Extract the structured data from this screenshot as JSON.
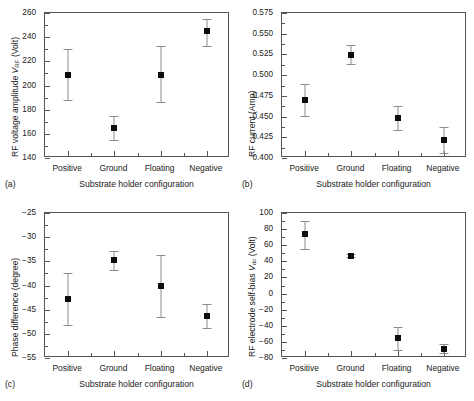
{
  "figure": {
    "shared_xlabel": "Substrate holder configuration",
    "categories": [
      "Positive",
      "Ground",
      "Floating",
      "Negative"
    ]
  },
  "panels": [
    {
      "letter": "(a)",
      "ylabel_pre": "RF voltage amplitude ",
      "ylabel_sym": "V",
      "ylabel_sub": "RF",
      "ylabel_post": " (Volt)",
      "ylabel_plain": "RF voltage amplitude V_RF (Volt)"
    },
    {
      "letter": "(b)",
      "ylabel_pre": "RF current (Amp)",
      "ylabel_sym": "",
      "ylabel_sub": "",
      "ylabel_post": "",
      "ylabel_plain": "RF current (Amp)"
    },
    {
      "letter": "(c)",
      "ylabel_pre": "Phase difference (degree)",
      "ylabel_sym": "",
      "ylabel_sub": "",
      "ylabel_post": "",
      "ylabel_plain": "Phase difference (degree)"
    },
    {
      "letter": "(d)",
      "ylabel_pre": "RF electrode self-bias ",
      "ylabel_sym": "V",
      "ylabel_sub": "dc",
      "ylabel_post": " (Volt)",
      "ylabel_plain": "RF electrode self-bias V_dc (Volt)"
    }
  ],
  "chart_data": [
    {
      "type": "scatter",
      "panel": "a",
      "title": "",
      "xlabel": "Substrate holder configuration",
      "ylabel": "RF voltage amplitude V_RF (Volt)",
      "categories": [
        "Positive",
        "Ground",
        "Floating",
        "Negative"
      ],
      "values": [
        209,
        165,
        209,
        245
      ],
      "err_low": [
        188,
        155,
        186,
        233
      ],
      "err_high": [
        230,
        175,
        233,
        255
      ],
      "ylim": [
        140,
        260
      ],
      "yticks": [
        140,
        160,
        180,
        200,
        220,
        240,
        260
      ],
      "ytick_labels": [
        "140",
        "160",
        "180",
        "200",
        "220",
        "240",
        "260"
      ],
      "minor_ticks_per_interval": 1,
      "grid": false,
      "legend": "none"
    },
    {
      "type": "scatter",
      "panel": "b",
      "title": "",
      "xlabel": "Substrate holder configuration",
      "ylabel": "RF current (Amp)",
      "categories": [
        "Positive",
        "Ground",
        "Floating",
        "Negative"
      ],
      "values": [
        0.47,
        0.524,
        0.448,
        0.422
      ],
      "err_low": [
        0.451,
        0.513,
        0.434,
        0.406
      ],
      "err_high": [
        0.489,
        0.536,
        0.463,
        0.438
      ],
      "ylim": [
        0.4,
        0.575
      ],
      "yticks": [
        0.4,
        0.425,
        0.45,
        0.475,
        0.5,
        0.525,
        0.55,
        0.575
      ],
      "ytick_labels": [
        "0.400",
        "0.425",
        "0.450",
        "0.475",
        "0.500",
        "0.525",
        "0.550",
        "0.575"
      ],
      "minor_ticks_per_interval": 1,
      "grid": false,
      "legend": "none"
    },
    {
      "type": "scatter",
      "panel": "c",
      "title": "",
      "xlabel": "Substrate holder configuration",
      "ylabel": "Phase difference (degree)",
      "categories": [
        "Positive",
        "Ground",
        "Floating",
        "Negative"
      ],
      "values": [
        -42.8,
        -34.8,
        -40.2,
        -46.3
      ],
      "err_low": [
        -48.2,
        -36.8,
        -46.6,
        -48.7
      ],
      "err_high": [
        -37.5,
        -32.8,
        -33.6,
        -43.8
      ],
      "ylim": [
        -55,
        -25
      ],
      "yticks": [
        -55,
        -50,
        -45,
        -40,
        -35,
        -30,
        -25
      ],
      "ytick_labels": [
        "−55",
        "−50",
        "−45",
        "−40",
        "−35",
        "−30",
        "−25"
      ],
      "minor_ticks_per_interval": 1,
      "grid": false,
      "legend": "none"
    },
    {
      "type": "scatter",
      "panel": "d",
      "title": "",
      "xlabel": "Substrate holder configuration",
      "ylabel": "RF electrode self-bias V_dc (Volt)",
      "categories": [
        "Positive",
        "Ground",
        "Floating",
        "Negative"
      ],
      "values": [
        74,
        47,
        -55,
        -69
      ],
      "err_low": [
        55,
        45,
        -70,
        -74
      ],
      "err_high": [
        90,
        49,
        -42,
        -63
      ],
      "ylim": [
        -80,
        100
      ],
      "yticks": [
        -80,
        -60,
        -40,
        -20,
        0,
        20,
        40,
        60,
        80,
        100
      ],
      "ytick_labels": [
        "−80",
        "−60",
        "−40",
        "−20",
        "0",
        "20",
        "40",
        "60",
        "80",
        "100"
      ],
      "minor_ticks_per_interval": 1,
      "grid": false,
      "legend": "none"
    }
  ]
}
